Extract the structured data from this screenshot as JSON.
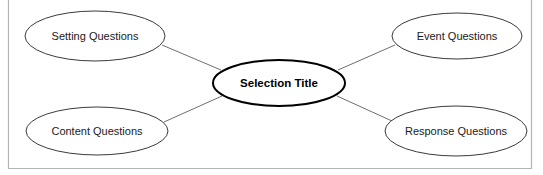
{
  "diagram": {
    "type": "hub-and-spoke",
    "background_color": "#ffffff",
    "frame": {
      "border_color": "#b4b4b4",
      "top_edge_visible": false
    },
    "center_node": {
      "id": "selection-title",
      "label": "Selection Title",
      "shape": "ellipse",
      "bold": true,
      "stroke_color": "#000000",
      "fill_color": "#ffffff",
      "cx": 279,
      "cy": 83,
      "rx": 66,
      "ry": 23
    },
    "nodes": [
      {
        "id": "setting-questions",
        "label": "Setting Questions",
        "shape": "ellipse",
        "position": "top-left",
        "stroke_color": "#3a3a3a",
        "fill_color": "#ffffff",
        "cx": 95,
        "cy": 36,
        "rx": 70,
        "ry": 25
      },
      {
        "id": "content-questions",
        "label": "Content Questions",
        "shape": "ellipse",
        "position": "bottom-left",
        "stroke_color": "#3a3a3a",
        "fill_color": "#ffffff",
        "cx": 97,
        "cy": 131,
        "rx": 71,
        "ry": 24
      },
      {
        "id": "event-questions",
        "label": "Event Questions",
        "shape": "ellipse",
        "position": "top-right",
        "stroke_color": "#3a3a3a",
        "fill_color": "#ffffff",
        "cx": 457,
        "cy": 36,
        "rx": 65,
        "ry": 23
      },
      {
        "id": "response-questions",
        "label": "Response Questions",
        "shape": "ellipse",
        "position": "bottom-right",
        "stroke_color": "#3a3a3a",
        "fill_color": "#ffffff",
        "cx": 456,
        "cy": 131,
        "rx": 71,
        "ry": 25
      }
    ],
    "connectors": [
      {
        "id": "setting-to-center",
        "from": "setting-questions",
        "to": "selection-title",
        "x1": 162,
        "y1": 45,
        "x2": 221,
        "y2": 70,
        "color": "#6e6e6e"
      },
      {
        "id": "content-to-center",
        "from": "content-questions",
        "to": "selection-title",
        "x1": 164,
        "y1": 122,
        "x2": 222,
        "y2": 96,
        "color": "#6e6e6e"
      },
      {
        "id": "center-to-event",
        "from": "selection-title",
        "to": "event-questions",
        "x1": 338,
        "y1": 70,
        "x2": 395,
        "y2": 45,
        "color": "#6e6e6e"
      },
      {
        "id": "center-to-response",
        "from": "selection-title",
        "to": "response-questions",
        "x1": 337,
        "y1": 96,
        "x2": 392,
        "y2": 121,
        "color": "#6e6e6e"
      }
    ]
  }
}
